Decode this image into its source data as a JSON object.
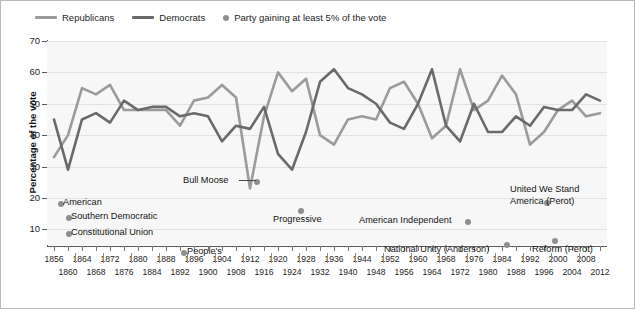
{
  "legend": {
    "items": [
      {
        "label": "Republicans",
        "marker": "line-swatch-republicans",
        "color": "#9b9b9b"
      },
      {
        "label": "Democrats",
        "marker": "line-swatch-democrats",
        "color": "#6a6a6a"
      },
      {
        "label": "Party gaining at least 5% of the vote",
        "marker": "dot-swatch-thirdparty",
        "color": "#8e8e8e"
      }
    ]
  },
  "axes": {
    "ylabel": "Percentage of the vote",
    "yticks": [
      10,
      20,
      30,
      40,
      50,
      60,
      70
    ],
    "ylim": [
      5,
      70
    ],
    "xlabel": "",
    "xlim": [
      1856,
      2012
    ],
    "grid": true
  },
  "chart_data": {
    "type": "line",
    "title": "",
    "xlabel": "",
    "ylabel": "Percentage of the vote",
    "ylim": [
      5,
      70
    ],
    "xlim": [
      1856,
      2012
    ],
    "grid": true,
    "legend_position": "top-left",
    "x": [
      1856,
      1860,
      1864,
      1868,
      1872,
      1876,
      1880,
      1884,
      1888,
      1892,
      1896,
      1900,
      1904,
      1908,
      1912,
      1916,
      1920,
      1924,
      1928,
      1932,
      1936,
      1940,
      1944,
      1948,
      1952,
      1956,
      1960,
      1964,
      1968,
      1972,
      1976,
      1980,
      1984,
      1988,
      1992,
      1996,
      2000,
      2004,
      2008,
      2012
    ],
    "series": [
      {
        "name": "Republicans",
        "color": "#9b9b9b",
        "values": [
          33,
          40,
          55,
          53,
          56,
          48,
          48,
          48,
          48,
          43,
          51,
          52,
          56,
          52,
          23,
          46,
          60,
          54,
          58,
          40,
          37,
          45,
          46,
          45,
          55,
          57,
          50,
          39,
          43,
          61,
          48,
          51,
          59,
          53,
          37,
          41,
          48,
          51,
          46,
          47
        ]
      },
      {
        "name": "Democrats",
        "color": "#6a6a6a",
        "values": [
          45,
          29,
          45,
          47,
          44,
          51,
          48,
          49,
          49,
          46,
          47,
          46,
          38,
          43,
          42,
          49,
          34,
          29,
          41,
          57,
          61,
          55,
          53,
          50,
          44,
          42,
          50,
          61,
          43,
          38,
          50,
          41,
          41,
          46,
          43,
          49,
          48,
          48,
          53,
          51
        ]
      }
    ],
    "annotations": [
      {
        "label": "American",
        "year": 1856,
        "value": 22,
        "dot_x": 57,
        "dot_y": 200,
        "text_x": 62,
        "text_y": 196
      },
      {
        "label": "Southern Democratic",
        "year": 1860,
        "value": 18,
        "dot_x": 65,
        "dot_y": 214,
        "text_x": 70,
        "text_y": 210
      },
      {
        "label": "Constitutional Union",
        "year": 1860,
        "value": 13,
        "dot_x": 65,
        "dot_y": 230,
        "text_x": 70,
        "text_y": 226
      },
      {
        "label": "People's",
        "year": 1892,
        "value": 9,
        "dot_x": 180,
        "dot_y": 249,
        "text_x": 186,
        "text_y": 245
      },
      {
        "label": "Bull Moose",
        "year": 1912,
        "value": 27,
        "dot_x": 253,
        "dot_y": 178,
        "text_x": 182,
        "text_y": 174,
        "leader": true
      },
      {
        "label": "Progressive",
        "year": 1924,
        "value": 17,
        "dot_x": 297,
        "dot_y": 207,
        "text_x": 272,
        "text_y": 213
      },
      {
        "label": "American Independent",
        "year": 1968,
        "value": 14,
        "dot_x": 464,
        "dot_y": 218,
        "text_x": 358,
        "text_y": 214
      },
      {
        "label": "National Unity (Anderson)",
        "year": 1980,
        "value": 7,
        "dot_x": 503,
        "dot_y": 241,
        "text_x": 383,
        "text_y": 243
      },
      {
        "label": "United We Stand America (Perot)",
        "year": 1992,
        "value": 19,
        "dot_x": 543,
        "dot_y": 199,
        "text_x": 509,
        "text_y": 183,
        "multiline": [
          "United We Stand",
          "America (Perot)"
        ]
      },
      {
        "label": "Reform (Perot)",
        "year": 1996,
        "value": 8,
        "dot_x": 551,
        "dot_y": 237,
        "text_x": 531,
        "text_y": 243
      }
    ]
  },
  "xaxis": {
    "labels": [
      "1856",
      "1860",
      "1864",
      "1868",
      "1872",
      "1876",
      "1880",
      "1884",
      "1888",
      "1892",
      "1896",
      "1900",
      "1904",
      "1908",
      "1912",
      "1916",
      "1920",
      "1924",
      "1928",
      "1932",
      "1936",
      "1940",
      "1944",
      "1948",
      "1952",
      "1956",
      "1960",
      "1964",
      "1968",
      "1972",
      "1976",
      "1980",
      "1984",
      "1988",
      "1992",
      "1996",
      "2000",
      "2004",
      "2008",
      "2012"
    ]
  }
}
